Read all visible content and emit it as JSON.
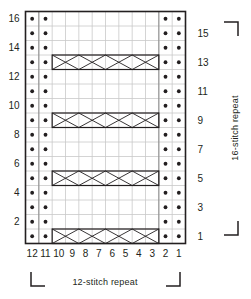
{
  "title": "Knitting Stitch Chart",
  "labels": {
    "bottom_repeat": "12-stitch  repeat",
    "side_repeat": "16-stitch  repeat"
  },
  "colors": {
    "grid_line": "#c9c9c9",
    "grid_line_major": "#8a8a8a",
    "border": "#231f20",
    "symbol": "#231f20",
    "text": "#231f20",
    "background": "#ffffff"
  },
  "chart_data": {
    "type": "table",
    "xlabel": "12-stitch  repeat",
    "ylabel": "16-stitch  repeat",
    "grid": true,
    "legend": "none",
    "columns": 12,
    "rows": 16,
    "column_labels": [
      "12",
      "11",
      "10",
      "9",
      "8",
      "7",
      "6",
      "5",
      "4",
      "3",
      "2",
      "1"
    ],
    "row_labels_left": [
      "16",
      "14",
      "12",
      "10",
      "8",
      "6",
      "4",
      "2"
    ],
    "row_labels_right": [
      "15",
      "13",
      "11",
      "9",
      "7",
      "5",
      "3",
      "1"
    ],
    "left_label_rows": [
      16,
      14,
      12,
      10,
      8,
      6,
      4,
      2
    ],
    "right_label_rows": [
      15,
      13,
      11,
      9,
      7,
      5,
      3,
      1
    ],
    "purl_dot_columns": [
      12,
      11,
      2,
      1
    ],
    "purl_dot_rows": [
      1,
      2,
      3,
      4,
      5,
      6,
      7,
      8,
      9,
      10,
      11,
      12,
      13,
      14,
      15,
      16
    ],
    "cable_rows": [
      1,
      5,
      9,
      13
    ],
    "cable_span_columns": [
      10,
      3
    ],
    "cable_description": "Cable crossing band spanning stitches 10 through 3 on rows 1, 5, 9 and 13"
  }
}
